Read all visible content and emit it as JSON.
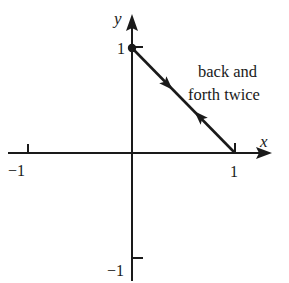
{
  "diagram": {
    "type": "parametric-path-plot",
    "axes": {
      "x_label": "x",
      "y_label": "y",
      "x_ticks": [
        {
          "value": -1,
          "label": "−1"
        },
        {
          "value": 1,
          "label": "1"
        }
      ],
      "y_ticks": [
        {
          "value": 1,
          "label": "1"
        },
        {
          "value": -1,
          "label": "−1"
        }
      ]
    },
    "path": {
      "start_point": [
        0,
        1
      ],
      "end_point": [
        1,
        0
      ],
      "start_marker": "filled-dot",
      "direction_arrows": [
        "toward (1,0)",
        "toward (0,1)"
      ]
    },
    "annotation": {
      "line1": "back and",
      "line2": "forth twice"
    },
    "colors": {
      "ink": "#1a1a1a",
      "background": "#ffffff"
    }
  }
}
